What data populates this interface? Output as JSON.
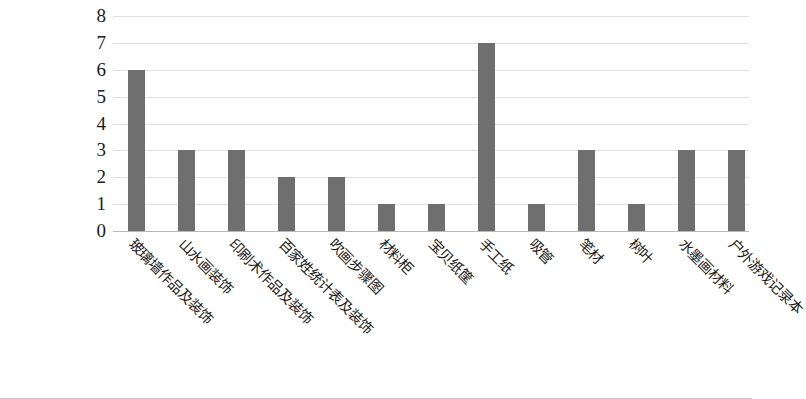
{
  "chart_data": {
    "type": "bar",
    "title": "",
    "subtitle": "",
    "xlabel": "",
    "ylabel": "",
    "ylim": [
      0,
      8
    ],
    "y_ticks": [
      "0",
      "1",
      "2",
      "3",
      "4",
      "5",
      "6",
      "7",
      "8"
    ],
    "grid": true,
    "legend": false,
    "legend_position": "none",
    "bar_color": "#6f6f6f",
    "gridline_color": "#e0e0e0",
    "axis_color": "#b8b8b8",
    "categories": [
      "玻璃墙作品及装饰",
      "山水画装饰",
      "印刷术作品及装饰",
      "百家姓统计表及装饰",
      "吹画步骤图",
      "材料柜",
      "宝贝纸筐",
      "手工纸",
      "吸管",
      "笔材",
      "树叶",
      "水墨画材料",
      "户外游戏记录本"
    ],
    "values": [
      6,
      3,
      3,
      2,
      2,
      1,
      1,
      7,
      1,
      3,
      1,
      3,
      3
    ],
    "series": [
      {
        "name": "",
        "values": [
          6,
          3,
          3,
          2,
          2,
          1,
          1,
          7,
          1,
          3,
          1,
          3,
          3
        ]
      }
    ]
  }
}
